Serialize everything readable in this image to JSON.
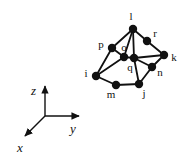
{
  "figure": {
    "background_color": "#ffffff",
    "ink_color": "#111111",
    "node_fill": "#111111",
    "node_radius": 4.2,
    "edge_width": 1.8,
    "axis_width": 1.4,
    "width": 191,
    "height": 165
  },
  "axes": {
    "origin": {
      "x": 45,
      "y": 116
    },
    "lines": [
      {
        "name": "z-axis",
        "x1": 45,
        "y1": 116,
        "x2": 45,
        "y2": 86,
        "label": "z",
        "label_x": 31,
        "label_y": 95
      },
      {
        "name": "y-axis",
        "x1": 45,
        "y1": 116,
        "x2": 79,
        "y2": 116,
        "label": "y",
        "label_x": 70,
        "label_y": 133
      },
      {
        "name": "x-axis",
        "x1": 45,
        "y1": 116,
        "x2": 25,
        "y2": 136,
        "label": "x",
        "label_x": 17,
        "label_y": 152
      }
    ],
    "labels": {
      "x": "x",
      "y": "y",
      "z": "z"
    }
  },
  "graph": {
    "nodes": [
      {
        "id": "l",
        "x": 133,
        "y": 29,
        "label": "l",
        "label_x": 131,
        "label_y": 20
      },
      {
        "id": "r",
        "x": 147,
        "y": 41,
        "label": "r",
        "label_x": 155,
        "label_y": 37
      },
      {
        "id": "p",
        "x": 112,
        "y": 48,
        "label": "p",
        "label_x": 101,
        "label_y": 48
      },
      {
        "id": "o",
        "x": 124,
        "y": 57,
        "label": "o",
        "label_x": 124,
        "label_y": 51
      },
      {
        "id": "q",
        "x": 134,
        "y": 58,
        "label": "q",
        "label_x": 130,
        "label_y": 71
      },
      {
        "id": "k",
        "x": 164,
        "y": 55,
        "label": "k",
        "label_x": 174,
        "label_y": 61
      },
      {
        "id": "n",
        "x": 152,
        "y": 67,
        "label": "n",
        "label_x": 160,
        "label_y": 76
      },
      {
        "id": "i",
        "x": 96,
        "y": 76,
        "label": "i",
        "label_x": 86,
        "label_y": 77
      },
      {
        "id": "m",
        "x": 116,
        "y": 85,
        "label": "m",
        "label_x": 111,
        "label_y": 98
      },
      {
        "id": "j",
        "x": 139,
        "y": 84,
        "label": "j",
        "label_x": 144,
        "label_y": 97
      }
    ],
    "edges": [
      {
        "from": "l",
        "to": "p"
      },
      {
        "from": "l",
        "to": "r"
      },
      {
        "from": "l",
        "to": "q"
      },
      {
        "from": "l",
        "to": "o"
      },
      {
        "from": "r",
        "to": "k"
      },
      {
        "from": "p",
        "to": "i"
      },
      {
        "from": "p",
        "to": "o"
      },
      {
        "from": "o",
        "to": "i"
      },
      {
        "from": "o",
        "to": "q"
      },
      {
        "from": "q",
        "to": "k"
      },
      {
        "from": "q",
        "to": "n"
      },
      {
        "from": "q",
        "to": "j"
      },
      {
        "from": "k",
        "to": "n"
      },
      {
        "from": "n",
        "to": "j"
      },
      {
        "from": "i",
        "to": "m"
      },
      {
        "from": "m",
        "to": "j"
      }
    ]
  }
}
